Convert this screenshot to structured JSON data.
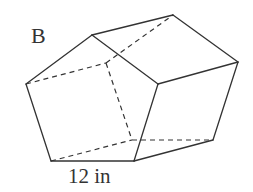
{
  "figure": {
    "label": "B",
    "dimension_label": "12 in",
    "shape": "pentagonal prism",
    "colors": {
      "line": "#333333",
      "background": "#ffffff"
    }
  },
  "vertices": {
    "front_top": [
      92,
      35
    ],
    "back_top": [
      173,
      15
    ],
    "right": [
      238,
      62
    ],
    "front_middle": [
      158,
      84
    ],
    "left": [
      26,
      84
    ],
    "bottom_left": [
      51,
      161
    ],
    "bottom_right": [
      134,
      161
    ],
    "back_bottom_right": [
      213,
      140
    ],
    "hidden_top": [
      106,
      63
    ],
    "hidden_bottom": [
      132,
      140
    ]
  }
}
